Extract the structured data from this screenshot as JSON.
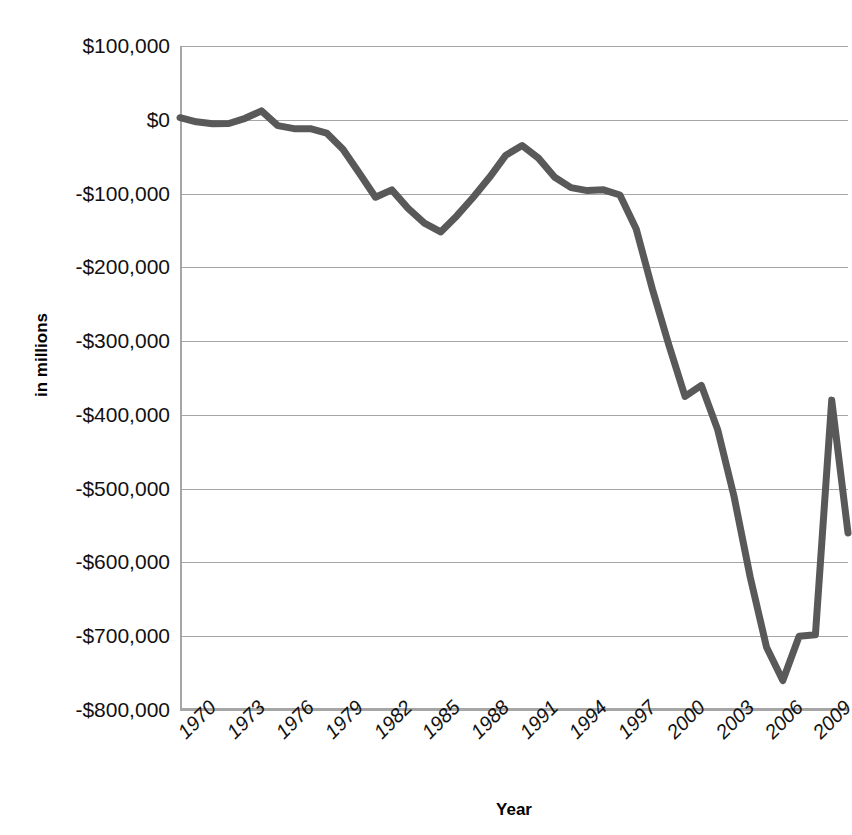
{
  "chart_data": {
    "type": "line",
    "title": "",
    "xlabel": "Year",
    "ylabel": "in millions",
    "xlim": [
      1970,
      2011
    ],
    "ylim": [
      -800000,
      100000
    ],
    "grid": true,
    "legend": "none",
    "series_color": "#595959",
    "x_tick_labels": [
      "1970",
      "1973",
      "1976",
      "1979",
      "1982",
      "1985",
      "1988",
      "1991",
      "1994",
      "1997",
      "2000",
      "2003",
      "2006",
      "2009"
    ],
    "x_tick_values": [
      1970,
      1973,
      1976,
      1979,
      1982,
      1985,
      1988,
      1991,
      1994,
      1997,
      2000,
      2003,
      2006,
      2009
    ],
    "y_tick_labels": [
      "$100,000",
      "$0",
      "-$100,000",
      "-$200,000",
      "-$300,000",
      "-$400,000",
      "-$500,000",
      "-$600,000",
      "-$700,000",
      "-$800,000"
    ],
    "y_tick_values": [
      100000,
      0,
      -100000,
      -200000,
      -300000,
      -400000,
      -500000,
      -600000,
      -700000,
      -800000
    ],
    "series": [
      {
        "name": "Budget Deficit",
        "x": [
          1970,
          1971,
          1972,
          1973,
          1974,
          1975,
          1976,
          1977,
          1978,
          1979,
          1980,
          1981,
          1982,
          1983,
          1984,
          1985,
          1986,
          1987,
          1988,
          1989,
          1990,
          1991,
          1992,
          1993,
          1994,
          1995,
          1996,
          1997,
          1998,
          1999,
          2000,
          2001,
          2002,
          2003,
          2004,
          2005,
          2006,
          2007,
          2008,
          2009,
          2010,
          2011
        ],
        "values": [
          2800,
          -2800,
          -5500,
          -5000,
          2000,
          12000,
          -8000,
          -12000,
          -12000,
          -18000,
          -40000,
          -72000,
          -105000,
          -95000,
          -120000,
          -140000,
          -152000,
          -130000,
          -105000,
          -78000,
          -48000,
          -35000,
          -52000,
          -78000,
          -92000,
          -96000,
          -95000,
          -102000,
          -148000,
          -230000,
          -305000,
          -375000,
          -360000,
          -420000,
          -510000,
          -620000,
          -715000,
          -760000,
          -700000,
          -698000,
          -380000,
          -560000
        ]
      }
    ]
  },
  "axes": {
    "y_title": "in millions",
    "x_title": "Year"
  }
}
